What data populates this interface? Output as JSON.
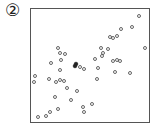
{
  "panel": {
    "label": "②"
  },
  "chart_data": {
    "type": "scatter",
    "title": "",
    "xlabel": "",
    "ylabel": "",
    "grid": false,
    "legend": null,
    "axis_ticks": "none",
    "note": "Coordinates are pixel positions within the 156x125 image; plot frame spans x 30-150, y 8-123. Shows positive correlation. One highlighted (filled) point near center.",
    "points": [
      {
        "x": 139,
        "y": 16
      },
      {
        "x": 132,
        "y": 27
      },
      {
        "x": 121,
        "y": 29
      },
      {
        "x": 117,
        "y": 36
      },
      {
        "x": 113,
        "y": 38
      },
      {
        "x": 110,
        "y": 37
      },
      {
        "x": 145,
        "y": 48
      },
      {
        "x": 101,
        "y": 48
      },
      {
        "x": 108,
        "y": 49
      },
      {
        "x": 58,
        "y": 48
      },
      {
        "x": 60,
        "y": 53
      },
      {
        "x": 65,
        "y": 54
      },
      {
        "x": 103,
        "y": 53
      },
      {
        "x": 102,
        "y": 56
      },
      {
        "x": 61,
        "y": 60
      },
      {
        "x": 95,
        "y": 59
      },
      {
        "x": 113,
        "y": 61
      },
      {
        "x": 117,
        "y": 60
      },
      {
        "x": 120,
        "y": 61
      },
      {
        "x": 51,
        "y": 63
      },
      {
        "x": 80,
        "y": 67
      },
      {
        "x": 84,
        "y": 69
      },
      {
        "x": 98,
        "y": 68
      },
      {
        "x": 60,
        "y": 70
      },
      {
        "x": 115,
        "y": 72
      },
      {
        "x": 130,
        "y": 73
      },
      {
        "x": 35,
        "y": 76
      },
      {
        "x": 49,
        "y": 79
      },
      {
        "x": 60,
        "y": 80
      },
      {
        "x": 64,
        "y": 81
      },
      {
        "x": 56,
        "y": 82
      },
      {
        "x": 97,
        "y": 79
      },
      {
        "x": 34,
        "y": 82
      },
      {
        "x": 67,
        "y": 88
      },
      {
        "x": 77,
        "y": 91
      },
      {
        "x": 55,
        "y": 97
      },
      {
        "x": 71,
        "y": 100
      },
      {
        "x": 92,
        "y": 104
      },
      {
        "x": 83,
        "y": 107
      },
      {
        "x": 58,
        "y": 109
      },
      {
        "x": 50,
        "y": 112
      },
      {
        "x": 84,
        "y": 112
      },
      {
        "x": 46,
        "y": 116
      },
      {
        "x": 38,
        "y": 117
      }
    ],
    "highlighted_points": [
      {
        "x": 76,
        "y": 64
      },
      {
        "x": 75,
        "y": 66
      }
    ]
  },
  "colors": {
    "marker": "#555555",
    "highlight": "#222222",
    "frame": "#555555"
  }
}
